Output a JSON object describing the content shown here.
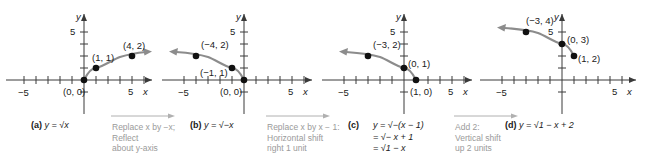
{
  "figure": {
    "axis_labels": {
      "x": "x",
      "y": "y"
    },
    "tick_labels": {
      "x_neg": "−5",
      "x_pos": "5",
      "y_pos": "5"
    },
    "curve_color": "#8c8c8c",
    "point_color": "#111111",
    "axis_color": "#3a3a3a",
    "note_color": "#9a9a9a"
  },
  "panels": [
    {
      "id": "a",
      "tag": "(a)",
      "equation": "y = √x",
      "equation_plain": "y = sqrt(x)",
      "points": [
        {
          "label": "(0, 0)",
          "x": 0,
          "y": 0
        },
        {
          "label": "(1, 1)",
          "x": 1,
          "y": 1
        },
        {
          "label": "(4, 2)",
          "x": 4,
          "y": 2
        }
      ],
      "xlim": [
        -6.2,
        6.2
      ],
      "ylim": [
        -1.4,
        6.2
      ],
      "direction": "right"
    },
    {
      "id": "b",
      "tag": "(b)",
      "equation": "y = √−x",
      "equation_plain": "y = sqrt(-x)",
      "points": [
        {
          "label": "(−4, 2)",
          "x": -4,
          "y": 2
        },
        {
          "label": "(−1, 1)",
          "x": -1,
          "y": 1
        },
        {
          "label": "(0, 0)",
          "x": 0,
          "y": 0
        }
      ],
      "xlim": [
        -6.2,
        6.2
      ],
      "ylim": [
        -1.4,
        6.2
      ],
      "direction": "left"
    },
    {
      "id": "c",
      "tag": "(c)",
      "equation_lines": [
        "y =  √−(x − 1)",
        "=  √− x + 1",
        "=  √1 − x"
      ],
      "points": [
        {
          "label": "(−3, 2)",
          "x": -3,
          "y": 2
        },
        {
          "label": "(0, 1)",
          "x": 0,
          "y": 1
        },
        {
          "label": "(1, 0)",
          "x": 1,
          "y": 0
        }
      ],
      "xlim": [
        -6.2,
        6.2
      ],
      "ylim": [
        -1.4,
        6.2
      ],
      "direction": "left"
    },
    {
      "id": "d",
      "tag": "(d)",
      "equation": "y = √1 − x + 2",
      "equation_plain": "y = sqrt(1-x) + 2",
      "points": [
        {
          "label": "(−3, 4)",
          "x": -3,
          "y": 4
        },
        {
          "label": "(0, 3)",
          "x": 0,
          "y": 3
        },
        {
          "label": "(1, 2)",
          "x": 1,
          "y": 2
        }
      ],
      "xlim": [
        -6.2,
        6.2
      ],
      "ylim": [
        -1.4,
        6.2
      ],
      "direction": "left"
    }
  ],
  "transitions": [
    {
      "id": "a-to-b",
      "lines": [
        "Replace x by −x;",
        "Reflect",
        "about y-axis"
      ]
    },
    {
      "id": "b-to-c",
      "lines": [
        "Replace x by x − 1:",
        "Horizontal shift",
        "right 1 unit"
      ]
    },
    {
      "id": "c-to-d",
      "lines": [
        "Add 2:",
        "Vertical shift",
        "up 2 units"
      ]
    }
  ]
}
